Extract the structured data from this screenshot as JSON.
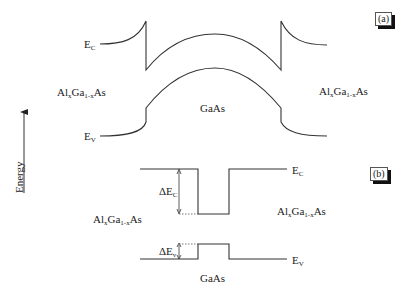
{
  "axis": {
    "label": "Energy"
  },
  "panel_a": {
    "tag": "(a)",
    "ec_label": {
      "main": "E",
      "sub": "C"
    },
    "ev_label": {
      "main": "E",
      "sub": "V"
    },
    "left_material": {
      "pre": "Al",
      "sub1": "x",
      "mid": "Ga",
      "sub2": "1-x",
      "post": "As"
    },
    "right_material": {
      "pre": "Al",
      "sub1": "x",
      "mid": "Ga",
      "sub2": "1-x",
      "post": "As"
    },
    "center_material": "GaAs"
  },
  "panel_b": {
    "tag": "(b)",
    "ec_label": {
      "main": "E",
      "sub": "C"
    },
    "ev_label": {
      "main": "E",
      "sub": "V"
    },
    "delta_ec": {
      "main": "ΔE",
      "sub": "C"
    },
    "delta_ev": {
      "main": "ΔE",
      "sub": "v"
    },
    "left_material": {
      "pre": "Al",
      "sub1": "x",
      "mid": "Ga",
      "sub2": "1-x",
      "post": "As"
    },
    "right_material": {
      "pre": "Al",
      "sub1": "x",
      "mid": "Ga",
      "sub2": "1-x",
      "post": "As"
    },
    "center_material": "GaAs"
  },
  "colors": {
    "line": "#333333",
    "shadow": "#111111"
  }
}
